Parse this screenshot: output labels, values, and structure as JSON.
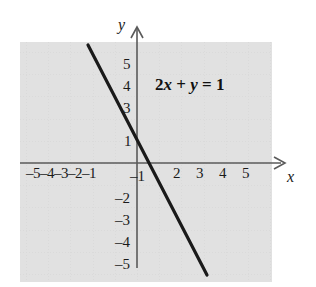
{
  "figure": {
    "name": "linear-equation-graph",
    "background_color": "#ffffff",
    "line_color": "#1a1a1a",
    "grid_color": "#c9c9c9",
    "axis_color": "#555555"
  },
  "annotation": {
    "equation_text": "2x + y = 1",
    "equation_parts": {
      "coefficient": "2",
      "var_x": "x",
      "plus": " + ",
      "var_y": "y",
      "equals": " = ",
      "constant": "1"
    }
  },
  "axes": {
    "x_axis_name": "x",
    "y_axis_name": "y",
    "x_negative_labels_text": "–5–4–3–2–1",
    "x_ticks_positive": [
      "2",
      "3",
      "4",
      "5"
    ],
    "y_ticks_positive": [
      "5",
      "4",
      "3",
      "1"
    ],
    "y_ticks_negative": [
      "–1",
      "–2",
      "–3",
      "–4",
      "–5"
    ]
  },
  "chart_data": {
    "type": "line",
    "title": "",
    "subtitle": "",
    "xlabel": "x",
    "ylabel": "y",
    "xlim": [
      -5.9,
      6.1
    ],
    "ylim": [
      -5.8,
      5.6
    ],
    "grid": true,
    "grid_style": "dotted",
    "legend": false,
    "legend_position": "none",
    "annotations": [
      {
        "text": "2x + y = 1",
        "x": 1.0,
        "y": 4.0,
        "bold": true
      }
    ],
    "xticks": [
      -5,
      -4,
      -3,
      -2,
      -1,
      2,
      3,
      4,
      5
    ],
    "xticklabels": [
      "–5",
      "–4",
      "–3",
      "–2",
      "–1",
      "2",
      "3",
      "4",
      "5"
    ],
    "yticks": [
      5,
      4,
      3,
      1,
      -1,
      -2,
      -3,
      -4,
      -5
    ],
    "yticklabels": [
      "5",
      "4",
      "3",
      "1",
      "–1",
      "–2",
      "–3",
      "–4",
      "–5"
    ],
    "series": [
      {
        "name": "2x + y = 1",
        "equation": "y = 1 - 2x",
        "slope": -2,
        "y_intercept": 1,
        "x_intercept": 0.5,
        "x": [
          -2.2,
          3.2
        ],
        "values": [
          5.4,
          -5.4
        ],
        "points": [
          {
            "x": -2.2,
            "y": 5.4
          },
          {
            "x": -2.0,
            "y": 5.0
          },
          {
            "x": -1.0,
            "y": 3.0
          },
          {
            "x": 0.0,
            "y": 1.0
          },
          {
            "x": 0.5,
            "y": 0.0
          },
          {
            "x": 1.0,
            "y": -1.0
          },
          {
            "x": 2.0,
            "y": -3.0
          },
          {
            "x": 3.0,
            "y": -5.0
          },
          {
            "x": 3.2,
            "y": -5.4
          }
        ],
        "style": "solid",
        "color": "#1a1a1a",
        "width": 3
      }
    ]
  }
}
